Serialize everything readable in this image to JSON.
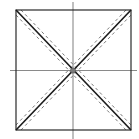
{
  "diagram": {
    "type": "geometric-construction",
    "colors": {
      "background": "#ffffff",
      "square": "#2a2a2a",
      "diagonal": "#1a1a1a",
      "dashed": "#6a6a6a",
      "axis": "#8a8a8a",
      "center_point": "#7a7a7a"
    },
    "square": {
      "x1": 16,
      "y1": 10,
      "x2": 131,
      "y2": 130
    },
    "center": {
      "x": 73,
      "y": 70.5,
      "r": 2.6
    },
    "axes": {
      "horizontal": {
        "y": 70.5,
        "x1": 10,
        "x2": 137
      },
      "vertical": {
        "x": 73,
        "y1": 2,
        "y2": 139
      }
    },
    "diagonal_offset": 4,
    "dash_pattern": "3 3"
  }
}
